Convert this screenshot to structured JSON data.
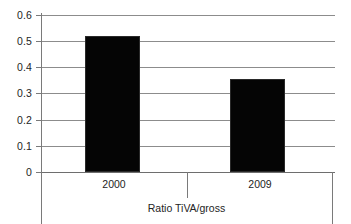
{
  "chart_data": {
    "type": "bar",
    "title": "",
    "xlabel": "Ratio TiVA/gross",
    "ylabel": "",
    "categories": [
      "2000",
      "2009"
    ],
    "values": [
      0.52,
      0.355
    ],
    "ylim": [
      0,
      0.6
    ],
    "ytick_labels": [
      "0.6",
      "0.5",
      "0.4",
      "0.3",
      "0.2",
      "0.1",
      "0"
    ],
    "ytick_values": [
      0.6,
      0.5,
      0.4,
      0.3,
      0.2,
      0.1,
      0
    ],
    "grid": true,
    "legend": "none",
    "series": [
      {
        "name": "Ratio TiVA/gross",
        "values": [
          0.52,
          0.355
        ],
        "color": "#050505"
      }
    ],
    "colors": {
      "bar": "#050505",
      "gridline": "#8c8c8c",
      "axis": "#7a7a7a",
      "background": "#ffffff",
      "text": "#242424"
    }
  }
}
